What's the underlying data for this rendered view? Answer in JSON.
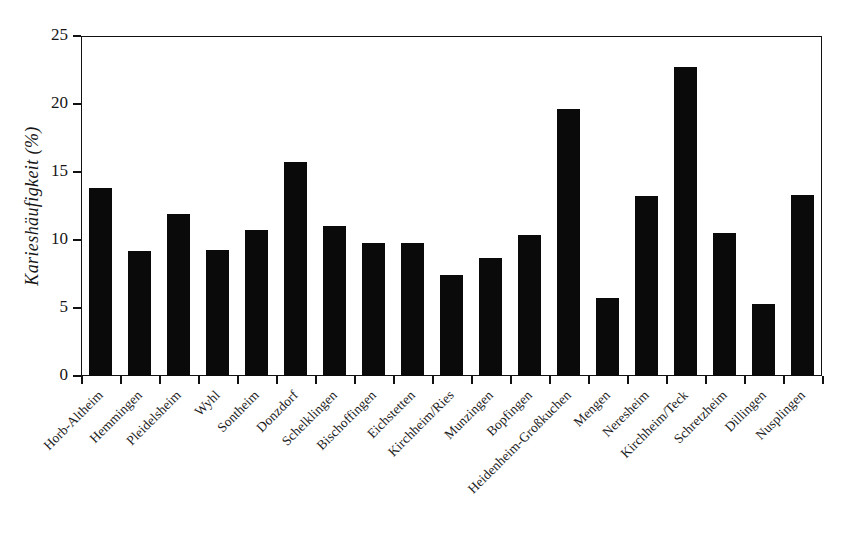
{
  "chart_data": {
    "type": "bar",
    "title": "",
    "subtitle": "",
    "xlabel": "",
    "ylabel": "Karieshäufigkeit (%)",
    "ylim": [
      0,
      25
    ],
    "yticks": [
      0,
      5,
      10,
      15,
      20,
      25
    ],
    "ytick_labels": [
      "0",
      "5",
      "10",
      "15",
      "20",
      "25"
    ],
    "grid": false,
    "legend": null,
    "bar_color": "#0a0a0a",
    "axis_color": "#111111",
    "categories": [
      "Horb-Altheim",
      "Hemmingen",
      "Pleidelsheim",
      "Wyhl",
      "Sontheim",
      "Donzdorf",
      "Schelklingen",
      "Bischoffingen",
      "Eichstetten",
      "Kirchheim/Ries",
      "Munzingen",
      "Bopfingen",
      "Heidenheim-Großkuchen",
      "Mengen",
      "Neresheim",
      "Kirchheim/Teck",
      "Schretzheim",
      "Dillingen",
      "Nusplingen"
    ],
    "values": [
      13.8,
      9.2,
      11.9,
      9.3,
      10.7,
      15.7,
      11.0,
      9.8,
      9.8,
      7.4,
      8.7,
      10.4,
      19.6,
      5.7,
      13.2,
      22.7,
      10.5,
      5.3,
      13.3
    ]
  }
}
